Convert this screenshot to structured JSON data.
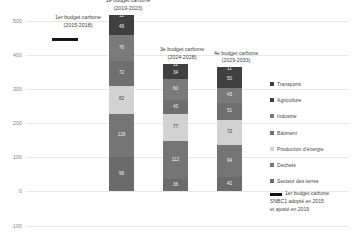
{
  "chart_data": {
    "type": "bar",
    "stacked": true,
    "title": "",
    "xlabel": "",
    "ylabel": "",
    "ylim": [
      -100,
      500
    ],
    "yticks": [
      500,
      400,
      300,
      200,
      100,
      0,
      -100
    ],
    "grid": true,
    "legend_position": "right",
    "categories": [
      "2e budget carbone\n(2019-2023)",
      "3e budget carbone\n(2024-2028)",
      "4e budget carbone\n(2029-2033)"
    ],
    "series": [
      {
        "name": "Transports",
        "color": "#3f3f3f",
        "values": [
          11,
          12,
          11
        ]
      },
      {
        "name": "Agriculture",
        "color": "#404040",
        "values": [
          49,
          34,
          50
        ]
      },
      {
        "name": "Industrie",
        "color": "#7a7a7a",
        "values": [
          76,
          60,
          43
        ]
      },
      {
        "name": "Bâtiment",
        "color": "#6f6f6f",
        "values": [
          72,
          43,
          51
        ]
      },
      {
        "name": "Production d'énergie",
        "color": "#d2d2d2",
        "values": [
          82,
          77,
          72
        ]
      },
      {
        "name": "Déchets",
        "color": "#757575",
        "values": [
          128,
          112,
          94
        ]
      },
      {
        "name": "Secteur des terres",
        "color": "#6b6b6b",
        "values": [
          99,
          36,
          42
        ]
      }
    ],
    "annotations": [
      {
        "id": "budget-1",
        "title_line1": "1er budget carbone",
        "title_line2": "(2015-2018)",
        "marker": "black-bar",
        "marker_color": "#161616"
      }
    ]
  },
  "bars": [
    {
      "id": "budget-2",
      "title_line1": "2e budget carbone",
      "title_line2": "(2019-2023)",
      "segments": [
        {
          "name": "Transports",
          "label": "11",
          "color": "#3f3f3f",
          "text": "dark"
        },
        {
          "name": "Agriculture",
          "label": "49",
          "color": "#404040",
          "text": "dark"
        },
        {
          "name": "Industrie",
          "label": "76",
          "color": "#7a7a7a",
          "text": "dark"
        },
        {
          "name": "Bâtiment",
          "label": "72",
          "color": "#6f6f6f",
          "text": "dark"
        },
        {
          "name": "Production d'énergie",
          "label": "82",
          "color": "#d2d2d2",
          "text": "light"
        },
        {
          "name": "Déchets",
          "label": "128",
          "color": "#757575",
          "text": "dark"
        },
        {
          "name": "Secteur des terres",
          "label": "99",
          "color": "#6b6b6b",
          "text": "dark"
        }
      ]
    },
    {
      "id": "budget-3",
      "title_line1": "3e budget carbone",
      "title_line2": "(2024-2028)",
      "segments": [
        {
          "name": "Transports",
          "label": "12",
          "color": "#3f3f3f",
          "text": "dark"
        },
        {
          "name": "Agriculture",
          "label": "34",
          "color": "#404040",
          "text": "dark"
        },
        {
          "name": "Industrie",
          "label": "60",
          "color": "#7a7a7a",
          "text": "dark"
        },
        {
          "name": "Bâtiment",
          "label": "43",
          "color": "#6f6f6f",
          "text": "dark"
        },
        {
          "name": "Production d'énergie",
          "label": "77",
          "color": "#d2d2d2",
          "text": "light"
        },
        {
          "name": "Déchets",
          "label": "112",
          "color": "#757575",
          "text": "dark"
        },
        {
          "name": "Secteur des terres",
          "label": "36",
          "color": "#6b6b6b",
          "text": "dark"
        }
      ]
    },
    {
      "id": "budget-4",
      "title_line1": "4e budget carbone",
      "title_line2": "(2029-2033)",
      "segments": [
        {
          "name": "Transports",
          "label": "11",
          "color": "#3f3f3f",
          "text": "dark"
        },
        {
          "name": "Agriculture",
          "label": "50",
          "color": "#404040",
          "text": "dark"
        },
        {
          "name": "Industrie",
          "label": "43",
          "color": "#7a7a7a",
          "text": "dark"
        },
        {
          "name": "Bâtiment",
          "label": "51",
          "color": "#6f6f6f",
          "text": "dark"
        },
        {
          "name": "Production d'énergie",
          "label": "72",
          "color": "#d2d2d2",
          "text": "light"
        },
        {
          "name": "Déchets",
          "label": "94",
          "color": "#757575",
          "text": "dark"
        },
        {
          "name": "Secteur des terres",
          "label": "42",
          "color": "#6b6b6b",
          "text": "dark"
        }
      ]
    }
  ],
  "axis": {
    "yticks": [
      "500",
      "400",
      "300",
      "200",
      "100",
      "0",
      "-100"
    ]
  },
  "first_budget": {
    "title_line1": "1er budget carbone",
    "title_line2": "(2015-2018)"
  },
  "legend": {
    "items": [
      {
        "label": "Transports",
        "color": "#3f3f3f"
      },
      {
        "label": "Agriculture",
        "color": "#404040"
      },
      {
        "label": "Industrie",
        "color": "#7a7a7a"
      },
      {
        "label": "Bâtiment",
        "color": "#6f6f6f"
      },
      {
        "label": "Production d'énergie",
        "color": "#d2d2d2"
      },
      {
        "label": "Déchets",
        "color": "#757575"
      },
      {
        "label": "Secteur des terres",
        "color": "#6b6b6b"
      }
    ],
    "note_line1": "1er budget carbone",
    "note_line2": "SNBC1 adopté en 2015",
    "note_line3": "et ajusté en 2019"
  }
}
